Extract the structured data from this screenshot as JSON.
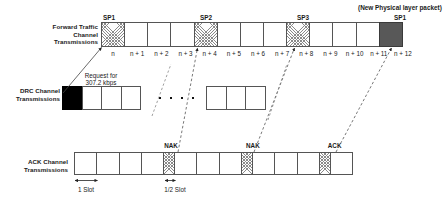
{
  "diagram": {
    "new_packet_note": "(New Physical layer packet)",
    "colors": {
      "line": "#555555",
      "hatch": "#8a8a8a",
      "dark_slot": "#585858",
      "black_slot": "#000000",
      "text": "#1a1a1a"
    }
  },
  "forward_row": {
    "label_lines": [
      "Forward Traffic",
      "Channel",
      "Transmissions"
    ],
    "slot_numbers": [
      "n",
      "n + 1",
      "n + 2",
      "n + 3",
      "n + 4",
      "n + 5",
      "n + 6",
      "n + 7",
      "n + 8",
      "n + 9",
      "n + 10",
      "n + 11",
      "n + 12"
    ],
    "cells": [
      {
        "index": 0,
        "fill": "hatch",
        "sp": "SP1"
      },
      {
        "index": 1,
        "fill": "none",
        "sp": ""
      },
      {
        "index": 2,
        "fill": "none",
        "sp": ""
      },
      {
        "index": 3,
        "fill": "none",
        "sp": ""
      },
      {
        "index": 4,
        "fill": "hatch",
        "sp": "SP2"
      },
      {
        "index": 5,
        "fill": "none",
        "sp": ""
      },
      {
        "index": 6,
        "fill": "none",
        "sp": ""
      },
      {
        "index": 7,
        "fill": "none",
        "sp": ""
      },
      {
        "index": 8,
        "fill": "hatch",
        "sp": "SP3"
      },
      {
        "index": 9,
        "fill": "none",
        "sp": ""
      },
      {
        "index": 10,
        "fill": "none",
        "sp": ""
      },
      {
        "index": 11,
        "fill": "none",
        "sp": ""
      },
      {
        "index": 12,
        "fill": "dark",
        "sp": "SP1"
      }
    ],
    "sp_captions": [
      "SP1",
      "SP2",
      "SP3",
      "SP1"
    ]
  },
  "drc_row": {
    "label_lines": [
      "DRC Channel",
      "Transmissions"
    ],
    "request_note_lines": [
      "Request for",
      "307.2 kbps"
    ],
    "left_group_cells": [
      {
        "index": 0,
        "fill": "black"
      },
      {
        "index": 1,
        "fill": "none"
      },
      {
        "index": 2,
        "fill": "none"
      },
      {
        "index": 3,
        "fill": "none"
      }
    ],
    "right_group_cells": [
      {
        "index": 0,
        "fill": "none"
      },
      {
        "index": 1,
        "fill": "none"
      },
      {
        "index": 2,
        "fill": "none"
      }
    ],
    "ellipsis_dots": 4
  },
  "ack_row": {
    "label_lines": [
      "ACK Channel",
      "Transmissions"
    ],
    "markers": [
      "NAK",
      "NAK",
      "ACK"
    ],
    "measures": [
      "1 Slot",
      "1/2 Slot"
    ],
    "cells": [
      {
        "index": 0,
        "fill": "none",
        "half": false,
        "marker": ""
      },
      {
        "index": 1,
        "fill": "none",
        "half": false,
        "marker": ""
      },
      {
        "index": 2,
        "fill": "none",
        "half": false,
        "marker": ""
      },
      {
        "index": 3,
        "fill": "none",
        "half": false,
        "marker": ""
      },
      {
        "index": 4,
        "fill": "hatch",
        "half": true,
        "marker": "NAK"
      },
      {
        "index": 5,
        "fill": "none",
        "half": false,
        "marker": ""
      },
      {
        "index": 6,
        "fill": "none",
        "half": false,
        "marker": ""
      },
      {
        "index": 7,
        "fill": "none",
        "half": false,
        "marker": ""
      },
      {
        "index": 8,
        "fill": "hatch",
        "half": true,
        "marker": "NAK"
      },
      {
        "index": 9,
        "fill": "none",
        "half": false,
        "marker": ""
      },
      {
        "index": 10,
        "fill": "none",
        "half": false,
        "marker": ""
      },
      {
        "index": 11,
        "fill": "none",
        "half": false,
        "marker": ""
      },
      {
        "index": 12,
        "fill": "hatch",
        "half": true,
        "marker": "ACK"
      },
      {
        "index": 13,
        "fill": "none",
        "half": false,
        "marker": ""
      }
    ]
  }
}
